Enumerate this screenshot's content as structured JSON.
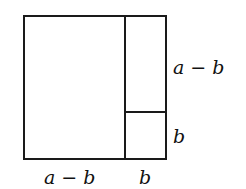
{
  "diagram": {
    "labels": {
      "right_top": "a − b",
      "right_bottom": "b",
      "bottom_left": "a − b",
      "bottom_right": "b"
    },
    "stroke_color": "#1a1a1a"
  }
}
